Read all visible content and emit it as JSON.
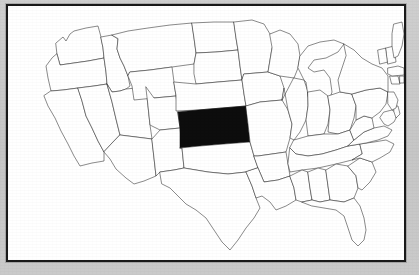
{
  "figure": {
    "type": "locator-map",
    "region": "United States (contiguous 48 states)",
    "title": "",
    "caption": "",
    "frame_color": "#1a1a1a",
    "page_background_color": "#c9c9c9",
    "map_background_color": "#ffffff",
    "state_outline_color": "#2b2b2b",
    "highlight_color": "#0d0d0d",
    "highlighted_state": "Kansas",
    "highlighted_state_abbr": "KS",
    "labels_visible": false,
    "legend_visible": false,
    "text_elements": []
  },
  "map": {
    "projection_hint": "simplified-equirectangular",
    "viewbox": "0 0 396 254",
    "states": [
      {
        "abbr": "WA",
        "name": "Washington",
        "highlighted": false,
        "d": "M48 37 L55 31 L58 35 L62 28 L66 25 L78 22 L90 20 L93 31 L95 42 L96 52 L80 55 L66 57 L52 59 L49 48 Z"
      },
      {
        "abbr": "OR",
        "name": "Oregon",
        "highlighted": false,
        "d": "M49 48 L52 59 L66 57 L80 55 L96 52 L98 66 L99 78 L86 80 L70 82 L55 84 L43 85 L40 72 L38 60 L44 52 Z"
      },
      {
        "abbr": "CA",
        "name": "California",
        "highlighted": false,
        "d": "M43 85 L55 84 L70 82 L74 95 L78 110 L84 122 L90 135 L96 146 L96 155 L84 157 L72 160 L66 150 L60 138 L53 125 L47 112 L40 100 L36 90 Z"
      },
      {
        "abbr": "NV",
        "name": "Nevada",
        "highlighted": false,
        "d": "M70 82 L86 80 L99 78 L104 96 L108 113 L112 129 L96 146 L90 135 L84 122 L78 110 L74 95 Z"
      },
      {
        "abbr": "ID",
        "name": "Idaho",
        "highlighted": false,
        "d": "M93 31 L104 29 L110 33 L109 43 L112 52 L116 60 L120 70 L122 80 L118 83 L112 85 L104 86 L99 78 L98 66 L96 52 L95 42 Z"
      },
      {
        "abbr": "UT",
        "name": "Utah",
        "highlighted": false,
        "d": "M99 78 L104 86 L112 85 L118 83 L138 81 L140 100 L142 119 L144 133 L112 129 L108 113 L104 96 Z"
      },
      {
        "abbr": "AZ",
        "name": "Arizona",
        "highlighted": false,
        "d": "M112 129 L144 133 L146 152 L148 170 L136 175 L126 178 L118 172 L108 163 L102 153 L96 146 Z"
      },
      {
        "abbr": "MT",
        "name": "Montana",
        "highlighted": false,
        "d": "M104 29 L120 25 L140 22 L162 19 L184 17 L186 32 L188 47 L186 58 L164 61 L142 64 L122 66 L120 70 L116 60 L112 52 L109 43 L110 33 Z"
      },
      {
        "abbr": "WY",
        "name": "Wyoming",
        "highlighted": false,
        "d": "M122 66 L142 64 L164 61 L166 76 L168 90 L146 92 L126 94 L124 80 L120 70 Z"
      },
      {
        "abbr": "CO",
        "name": "Colorado",
        "highlighted": false,
        "d": "M138 81 L146 92 L168 90 L170 106 L172 122 L152 124 L142 119 L140 100 Z"
      },
      {
        "abbr": "NM",
        "name": "New Mexico",
        "highlighted": false,
        "d": "M144 133 L152 124 L172 122 L174 142 L176 162 L166 164 L152 166 L148 170 L146 152 Z"
      },
      {
        "abbr": "ND",
        "name": "North Dakota",
        "highlighted": false,
        "d": "M184 17 L206 16 L226 16 L228 32 L230 44 L208 46 L188 47 L186 32 Z"
      },
      {
        "abbr": "SD",
        "name": "South Dakota",
        "highlighted": false,
        "d": "M186 58 L188 47 L208 46 L230 44 L232 60 L234 74 L210 76 L188 78 L186 68 Z"
      },
      {
        "abbr": "NE",
        "name": "Nebraska",
        "highlighted": false,
        "d": "M166 76 L188 78 L210 76 L234 74 L236 88 L238 100 L214 102 L190 104 L168 105 L168 90 Z"
      },
      {
        "abbr": "KS",
        "name": "Kansas",
        "highlighted": true,
        "d": "M170 106 L190 104 L214 102 L238 100 L240 118 L242 136 L216 138 L192 140 L172 142 L172 122 Z"
      },
      {
        "abbr": "OK",
        "name": "Oklahoma",
        "highlighted": false,
        "d": "M172 142 L192 140 L216 138 L242 136 L246 150 L250 162 L238 166 L220 168 L200 166 L188 164 L176 162 L174 142 Z"
      },
      {
        "abbr": "TX",
        "name": "Texas",
        "highlighted": false,
        "d": "M152 166 L166 164 L176 162 L188 164 L200 166 L220 168 L238 166 L244 180 L248 192 L252 202 L246 212 L238 222 L230 234 L222 244 L214 236 L206 224 L198 212 L188 204 L178 198 L170 190 L162 182 L154 178 Z"
      },
      {
        "abbr": "MN",
        "name": "Minnesota",
        "highlighted": false,
        "d": "M226 16 L244 14 L256 18 L262 28 L268 30 L264 42 L262 54 L260 66 L236 68 L234 74 L232 60 L230 44 L228 32 Z"
      },
      {
        "abbr": "IA",
        "name": "Iowa",
        "highlighted": false,
        "d": "M236 68 L260 66 L272 70 L276 82 L274 94 L252 96 L238 100 L236 88 L234 74 Z"
      },
      {
        "abbr": "MO",
        "name": "Missouri",
        "highlighted": false,
        "d": "M238 100 L252 96 L274 94 L280 104 L284 118 L282 132 L278 146 L264 148 L250 150 L246 150 L242 136 L240 118 Z"
      },
      {
        "abbr": "AR",
        "name": "Arkansas",
        "highlighted": false,
        "d": "M246 150 L250 150 L264 148 L278 146 L280 158 L282 170 L270 174 L256 176 L250 162 Z"
      },
      {
        "abbr": "LA",
        "name": "Louisiana",
        "highlighted": false,
        "d": "M250 162 L256 176 L270 174 L282 170 L286 182 L288 194 L278 200 L268 204 L262 196 L254 190 L248 192 L244 180 L238 166 Z"
      },
      {
        "abbr": "WI",
        "name": "Wisconsin",
        "highlighted": false,
        "d": "M262 28 L272 24 L282 28 L290 38 L292 50 L290 62 L286 72 L272 70 L260 66 L262 54 L264 42 Z"
      },
      {
        "abbr": "IL",
        "name": "Illinois",
        "highlighted": false,
        "d": "M286 72 L296 74 L300 86 L300 100 L298 114 L292 126 L286 134 L282 132 L284 118 L280 104 L276 82 L274 94 Z"
      },
      {
        "abbr": "MI",
        "name": "Michigan",
        "highlighted": false,
        "d": "M292 50 L300 40 L312 36 L326 34 L336 38 L330 46 L318 52 L306 54 L300 62 L306 66 L316 64 L322 72 L324 86 L320 98 L312 106 L304 102 L300 90 L298 76 L296 74 L290 62 Z"
      },
      {
        "abbr": "IN",
        "name": "Indiana",
        "highlighted": false,
        "d": "M300 86 L312 84 L320 90 L322 104 L320 118 L316 128 L300 130 L298 114 L300 100 Z"
      },
      {
        "abbr": "OH",
        "name": "Ohio",
        "highlighted": false,
        "d": "M320 90 L332 86 L344 88 L348 100 L346 112 L342 124 L330 128 L320 126 L322 104 Z"
      },
      {
        "abbr": "KY",
        "name": "Kentucky",
        "highlighted": false,
        "d": "M286 134 L300 130 L316 128 L330 128 L342 124 L346 134 L340 140 L328 144 L314 148 L300 150 L288 148 L282 142 Z"
      },
      {
        "abbr": "TN",
        "name": "Tennessee",
        "highlighted": false,
        "d": "M282 142 L288 148 L300 150 L314 148 L328 144 L340 140 L352 138 L354 148 L344 154 L328 158 L310 162 L294 164 L282 166 L280 158 Z"
      },
      {
        "abbr": "MS",
        "name": "Mississippi",
        "highlighted": false,
        "d": "M282 170 L294 164 L300 166 L302 182 L304 194 L294 196 L288 194 L286 182 Z"
      },
      {
        "abbr": "AL",
        "name": "Alabama",
        "highlighted": false,
        "d": "M300 166 L310 162 L318 164 L320 180 L322 194 L312 196 L304 194 L302 182 Z"
      },
      {
        "abbr": "GA",
        "name": "Georgia",
        "highlighted": false,
        "d": "M318 164 L328 158 L340 160 L348 170 L350 182 L346 192 L336 196 L322 194 L320 180 Z"
      },
      {
        "abbr": "FL",
        "name": "Florida",
        "highlighted": false,
        "d": "M294 196 L304 194 L312 196 L322 194 L336 196 L346 192 L352 200 L356 212 L358 224 L356 234 L350 240 L344 234 L340 222 L336 210 L328 204 L316 202 L304 200 Z"
      },
      {
        "abbr": "SC",
        "name": "South Carolina",
        "highlighted": false,
        "d": "M340 160 L352 152 L364 156 L368 166 L362 176 L354 184 L350 182 L348 170 Z"
      },
      {
        "abbr": "NC",
        "name": "North Carolina",
        "highlighted": false,
        "d": "M352 138 L366 136 L378 134 L386 138 L382 146 L372 152 L364 156 L352 152 L344 154 L354 148 Z"
      },
      {
        "abbr": "VA",
        "name": "Virginia",
        "highlighted": false,
        "d": "M346 134 L356 126 L366 122 L376 120 L384 124 L380 130 L370 134 L358 137 L352 138 L340 140 Z"
      },
      {
        "abbr": "WV",
        "name": "West Virginia",
        "highlighted": false,
        "d": "M342 124 L348 114 L356 110 L364 112 L366 122 L356 126 L346 134 Z"
      },
      {
        "abbr": "PA",
        "name": "Pennsylvania",
        "highlighted": false,
        "d": "M344 88 L358 84 L372 82 L380 86 L378 98 L372 106 L364 112 L356 110 L348 114 L348 100 Z"
      },
      {
        "abbr": "NY",
        "name": "New York",
        "highlighted": false,
        "d": "M336 38 L346 44 L354 52 L364 58 L374 62 L380 70 L380 86 L372 82 L358 84 L344 88 L332 86 L330 74 L334 62 L338 50 Z"
      },
      {
        "abbr": "MD",
        "name": "Maryland",
        "highlighted": false,
        "d": "M376 106 L384 104 L390 108 L386 116 L380 120 L376 118 L372 112 Z"
      },
      {
        "abbr": "DE",
        "name": "Delaware",
        "highlighted": false,
        "d": "M386 100 L390 100 L392 108 L388 112 L386 106 Z"
      },
      {
        "abbr": "NJ",
        "name": "New Jersey",
        "highlighted": false,
        "d": "M380 86 L386 86 L390 94 L388 102 L384 104 L380 98 Z"
      },
      {
        "abbr": "CT",
        "name": "Connecticut",
        "highlighted": false,
        "d": "M382 70 L390 70 L392 78 L384 78 Z"
      },
      {
        "abbr": "RI",
        "name": "Rhode Island",
        "highlighted": false,
        "d": "M392 70 L396 70 L396 77 L392 77 Z"
      },
      {
        "abbr": "MA",
        "name": "Massachusetts",
        "highlighted": false,
        "d": "M380 62 L390 60 L396 62 L396 69 L384 70 L380 68 Z"
      },
      {
        "abbr": "VT",
        "name": "Vermont",
        "highlighted": false,
        "d": "M370 44 L378 42 L380 56 L372 58 Z"
      },
      {
        "abbr": "NH",
        "name": "New Hampshire",
        "highlighted": false,
        "d": "M378 42 L386 40 L388 56 L380 58 Z"
      },
      {
        "abbr": "ME",
        "name": "Maine",
        "highlighted": false,
        "d": "M386 18 L394 16 L396 28 L394 40 L390 50 L386 52 L384 40 L384 28 Z"
      }
    ]
  }
}
